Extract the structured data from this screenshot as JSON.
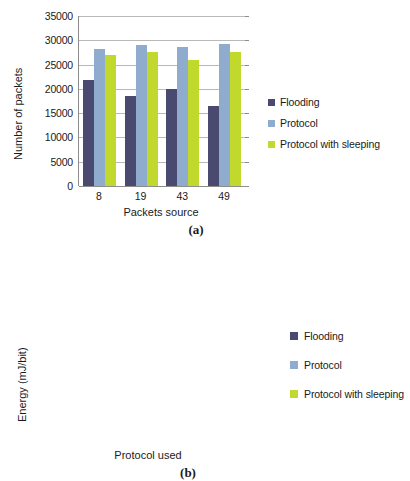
{
  "chart_data": [
    {
      "id": "a",
      "type": "bar",
      "title": "",
      "caption": "(a)",
      "xlabel": "Packets source",
      "ylabel": "Number of packets",
      "categories": [
        "8",
        "19",
        "43",
        "49"
      ],
      "ylim": [
        0,
        35000
      ],
      "yticks": [
        0,
        5000,
        10000,
        15000,
        20000,
        25000,
        30000,
        35000
      ],
      "ytick_labels": [
        "0",
        "5000",
        "10000",
        "15000",
        "20000",
        "25000",
        "30000",
        "35000"
      ],
      "grid": true,
      "legend_position": "right",
      "series": [
        {
          "name": "Flooding",
          "color": "#4a4a70",
          "values": [
            21800,
            18600,
            19900,
            16500
          ]
        },
        {
          "name": "Protocol",
          "color": "#8faccf",
          "values": [
            28200,
            29000,
            28700,
            29200
          ]
        },
        {
          "name": "Protocol with sleeping",
          "color": "#c0d92c",
          "values": [
            27000,
            27600,
            26000,
            27600
          ]
        }
      ]
    },
    {
      "id": "b",
      "type": "bar",
      "title": "",
      "caption": "(b)",
      "xlabel": "Protocol used",
      "ylabel": "Energy (mJ/bit)",
      "categories": [
        "Flooding",
        "Protocol",
        "Protocol with sleeping"
      ],
      "ylim": [
        0,
        0.6
      ],
      "yticks": [
        0,
        0.1,
        0.2,
        0.3,
        0.4,
        0.5,
        0.6
      ],
      "ytick_labels": [
        "0",
        "0.1",
        "0.2",
        "0.3",
        "0.4",
        "0.5",
        "0.6"
      ],
      "grid": true,
      "legend_position": "right",
      "series": [
        {
          "name": "Flooding",
          "color": "#4a4a70",
          "values": [
            0.5
          ]
        },
        {
          "name": "Protocol",
          "color": "#8faccf",
          "values": [
            0.325
          ]
        },
        {
          "name": "Protocol with sleeping",
          "color": "#c0d92c",
          "values": [
            0.26
          ]
        }
      ]
    }
  ],
  "figure_a": {
    "ylabel": "Number of packets",
    "xlabel": "Packets source",
    "caption": "(a)",
    "ytick_labels": [
      "35000",
      "30000",
      "25000",
      "20000",
      "15000",
      "10000",
      "5000",
      "0"
    ],
    "xtick_labels": [
      "8",
      "19",
      "43",
      "49"
    ],
    "legend": [
      {
        "label": "Flooding",
        "color": "#4a4a70"
      },
      {
        "label": "Protocol",
        "color": "#8faccf"
      },
      {
        "label": "Protocol with sleeping",
        "color": "#c0d92c"
      }
    ]
  },
  "figure_b": {
    "ylabel": "Energy (mJ/bit)",
    "xlabel": "Protocol used",
    "caption": "(b)",
    "ytick_labels": [
      "0.6",
      "0.5",
      "0.4",
      "0.3",
      "0.2",
      "0.1",
      "0"
    ],
    "legend": [
      {
        "label": "Flooding",
        "color": "#4a4a70"
      },
      {
        "label": "Protocol",
        "color": "#8faccf"
      },
      {
        "label": "Protocol with sleeping",
        "color": "#c0d92c"
      }
    ]
  }
}
